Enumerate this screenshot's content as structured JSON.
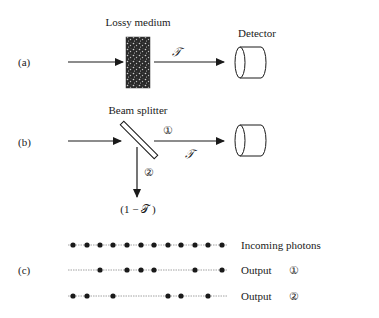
{
  "panels": {
    "a": {
      "label": "(a)",
      "medium_label": "Lossy medium",
      "transmission_label": "𝒯",
      "detector_label": "Detector"
    },
    "b": {
      "label": "(b)",
      "splitter_label": "Beam splitter",
      "output1_marker": "①",
      "output2_marker": "②",
      "transmission_label": "𝒯",
      "reflection_label": "(1 − 𝒯 )"
    },
    "c": {
      "label": "(c)",
      "rows": [
        {
          "label": "Incoming photons",
          "marker": "",
          "dots": [
            0,
            1,
            2,
            3,
            4,
            5,
            6,
            7,
            8,
            9,
            10,
            11
          ]
        },
        {
          "label": "Output",
          "marker": "①",
          "dots": [
            2,
            4,
            5,
            6,
            9,
            11
          ]
        },
        {
          "label": "Output",
          "marker": "②",
          "dots": [
            0,
            1,
            3,
            7,
            8,
            10
          ]
        }
      ],
      "dot_x": [
        73,
        87,
        100,
        113,
        127,
        141,
        154,
        168,
        181,
        195,
        208,
        222
      ]
    }
  },
  "colors": {
    "ink": "#1a1a1a",
    "dotted_line": "#8a8a8a"
  }
}
